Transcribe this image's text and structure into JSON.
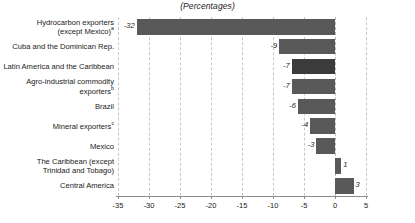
{
  "chart": {
    "title": "(Percentages)",
    "axis_label_left": "",
    "tick_labels": [
      "-35",
      "-30",
      "-25",
      "-20",
      "-15",
      "-10",
      "-5",
      "0",
      "5"
    ],
    "bar_color": "#595959",
    "highlight_color": "#3b3b3b",
    "gridline_color": "#c8c8c8",
    "axis_color": "#8c8c8c"
  },
  "chart_data": {
    "type": "bar",
    "orientation": "horizontal",
    "title": "(Percentages)",
    "xlabel": "",
    "ylabel": "",
    "xlim": [
      -35,
      5
    ],
    "xticks": [
      -35,
      -30,
      -25,
      -20,
      -15,
      -10,
      -5,
      0,
      5
    ],
    "grid": true,
    "legend": "none",
    "categories": [
      "Hydrocarbon exporters (except Mexico)",
      "Cuba and the Dominican Rep.",
      "Latin America and the Caribbean",
      "Agro-industrial commodity exporters",
      "Brazil",
      "Mineral exporters",
      "Mexico",
      "The Caribbean (except Trinidad and Tobago)",
      "Central America"
    ],
    "values": [
      -32,
      -9,
      -7,
      -7,
      -6,
      -4,
      -3,
      1,
      3
    ],
    "value_labels": [
      "-32",
      "-9",
      "-7",
      "-7",
      "-6",
      "-4",
      "-3",
      "1",
      "3"
    ],
    "footnote_markers": [
      "a",
      "",
      "",
      "b",
      "",
      "c",
      "",
      "",
      ""
    ],
    "highlighted_category": "Latin America and the Caribbean"
  },
  "rows": [
    {
      "label_line1": "Hydrocarbon exporters",
      "label_line2": "(except Mexico)",
      "sup": "a",
      "value": -32,
      "value_label": "-32",
      "highlight": false
    },
    {
      "label_line1": "Cuba and the Dominican Rep.",
      "label_line2": "",
      "sup": "",
      "value": -9,
      "value_label": "-9",
      "highlight": false
    },
    {
      "label_line1": "Latin America and the Caribbean",
      "label_line2": "",
      "sup": "",
      "value": -7,
      "value_label": "-7",
      "highlight": true
    },
    {
      "label_line1": "Agro-industrial commodity",
      "label_line2": "exporters",
      "sup": "b",
      "value": -7,
      "value_label": "-7",
      "highlight": false
    },
    {
      "label_line1": "Brazil",
      "label_line2": "",
      "sup": "",
      "value": -6,
      "value_label": "-6",
      "highlight": false
    },
    {
      "label_line1": "Mineral exporters",
      "label_line2": "",
      "sup": "c",
      "value": -4,
      "value_label": "-4",
      "highlight": false
    },
    {
      "label_line1": "Mexico",
      "label_line2": "",
      "sup": "",
      "value": -3,
      "value_label": "-3",
      "highlight": false
    },
    {
      "label_line1": "The Caribbean (except",
      "label_line2": "Trinidad and Tobago)",
      "sup": "",
      "value": 1,
      "value_label": "1",
      "highlight": false
    },
    {
      "label_line1": "Central America",
      "label_line2": "",
      "sup": "",
      "value": 3,
      "value_label": "3",
      "highlight": false
    }
  ]
}
